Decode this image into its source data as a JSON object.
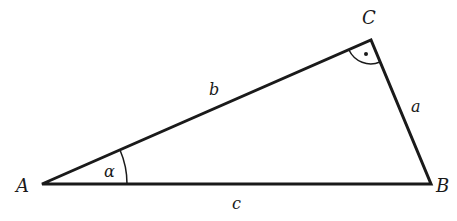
{
  "diagram": {
    "type": "right-triangle",
    "vertices": {
      "A": "A",
      "B": "B",
      "C": "C"
    },
    "sides": {
      "a": "a",
      "b": "b",
      "c": "c"
    },
    "angle": "α",
    "right_angle_at": "C",
    "colors": {
      "stroke": "#1a1a1a",
      "background": "#ffffff"
    }
  }
}
